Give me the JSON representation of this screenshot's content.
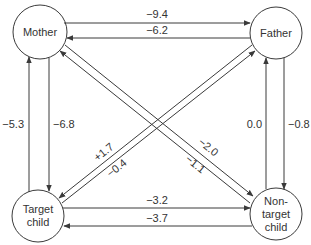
{
  "colors": {
    "stroke": "#3a3a3a",
    "text": "#333333",
    "background": "#ffffff"
  },
  "nodes": {
    "mother": {
      "lines": [
        "Mother"
      ]
    },
    "father": {
      "lines": [
        "Father"
      ]
    },
    "target_child": {
      "lines": [
        "Target",
        "child"
      ]
    },
    "nontarget_child": {
      "lines": [
        "Non-",
        "target",
        "child"
      ]
    }
  },
  "edges": {
    "mother_to_father": {
      "from": "Mother",
      "to": "Father",
      "value": "−9.4"
    },
    "father_to_mother": {
      "from": "Father",
      "to": "Mother",
      "value": "−6.2"
    },
    "target_to_mother": {
      "from": "Target child",
      "to": "Mother",
      "value": "−5.3"
    },
    "mother_to_target": {
      "from": "Mother",
      "to": "Target child",
      "value": "−6.8"
    },
    "nontarget_to_father": {
      "from": "Non-target child",
      "to": "Father",
      "value": "0.0"
    },
    "father_to_nontarget": {
      "from": "Father",
      "to": "Non-target child",
      "value": "−0.8"
    },
    "father_to_target": {
      "from": "Father",
      "to": "Target child",
      "value": "+1.7"
    },
    "target_to_father": {
      "from": "Target child",
      "to": "Father",
      "value": "−0.4"
    },
    "mother_to_nontarget": {
      "from": "Mother",
      "to": "Non-target child",
      "value": "−2.0"
    },
    "nontarget_to_mother": {
      "from": "Non-target child",
      "to": "Mother",
      "value": "−1.1"
    },
    "target_to_nontarget": {
      "from": "Target child",
      "to": "Non-target child",
      "value": "−3.2"
    },
    "nontarget_to_target": {
      "from": "Non-target child",
      "to": "Target child",
      "value": "−3.7"
    }
  }
}
